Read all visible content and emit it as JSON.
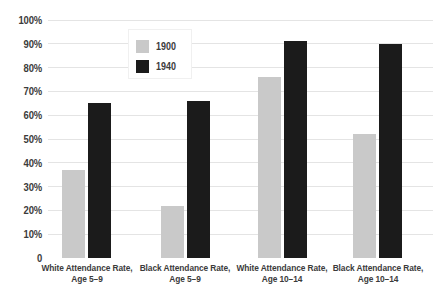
{
  "chart_data": {
    "type": "bar",
    "title": "",
    "xlabel": "",
    "ylabel": "",
    "categories": [
      [
        "White Attendance Rate,",
        "Age 5–9"
      ],
      [
        "Black Attendance Rate,",
        "Age 5–9"
      ],
      [
        "White Attendance Rate,",
        "Age 10–14"
      ],
      [
        "Black Attendance Rate,",
        "Age 10–14"
      ]
    ],
    "series": [
      {
        "name": "1900",
        "color": "#c9c9c9",
        "values": [
          37,
          22,
          76,
          52
        ]
      },
      {
        "name": "1940",
        "color": "#1b1b1b",
        "values": [
          65,
          66,
          91,
          90
        ]
      }
    ],
    "ylim": [
      0,
      100
    ],
    "y_ticks": [
      {
        "value": 100,
        "label": "100%"
      },
      {
        "value": 90,
        "label": "90%"
      },
      {
        "value": 80,
        "label": "80%"
      },
      {
        "value": 70,
        "label": "70%"
      },
      {
        "value": 60,
        "label": "60%"
      },
      {
        "value": 50,
        "label": "50%"
      },
      {
        "value": 40,
        "label": "40%"
      },
      {
        "value": 30,
        "label": "30%"
      },
      {
        "value": 20,
        "label": "20%"
      },
      {
        "value": 10,
        "label": "10%"
      },
      {
        "value": 0,
        "label": "0"
      }
    ],
    "grid": true,
    "legend_position": "upper-left-inside"
  },
  "colors": {
    "background": "#ffffff",
    "gridline": "#e4e4e4",
    "text": "#3b3b3b",
    "legend_border": "#f0f0f0",
    "series_1900": "#c9c9c9",
    "series_1940": "#1b1b1b"
  }
}
